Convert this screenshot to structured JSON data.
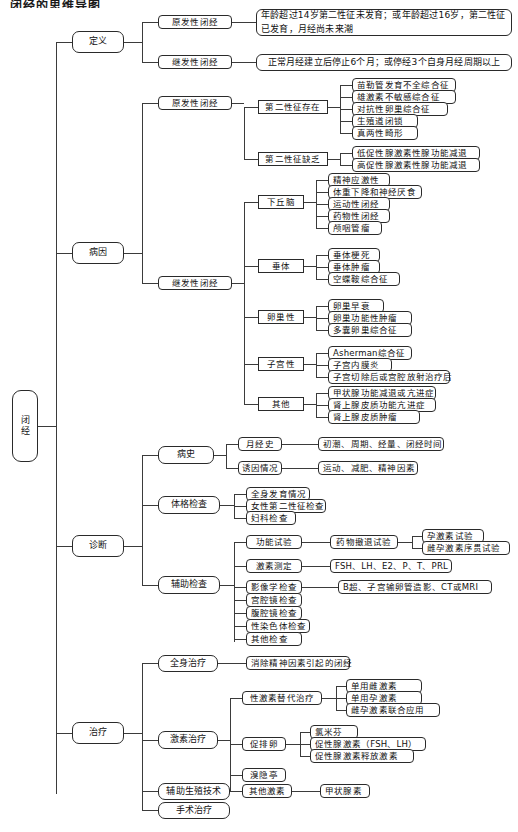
{
  "document": {
    "title_partial": "闭经的思维导图",
    "root": "闭经"
  },
  "branches": {
    "definition": {
      "label": "定义",
      "children": [
        {
          "label": "原发性闭经",
          "detail": "年龄超过14岁第二性征未发育；或年龄超过16岁，第二性征已发育，月经尚未来潮"
        },
        {
          "label": "继发性闭经",
          "detail": "正常月经建立后停止6个月；或停经3个自身月经周期以上"
        }
      ]
    },
    "etiology": {
      "label": "病因",
      "children": [
        {
          "label": "原发性闭经",
          "groups": [
            {
              "label": "第二性征存在",
              "items": [
                "苗勒管发育不全综合征",
                "雄激素不敏感综合征",
                "对抗性卵巢综合征",
                "生殖道闭锁",
                "真两性畸形"
              ]
            },
            {
              "label": "第二性征缺乏",
              "items": [
                "低促性腺激素性腺功能减退",
                "高促性腺激素性腺功能减退"
              ]
            }
          ]
        },
        {
          "label": "继发性闭经",
          "groups": [
            {
              "label": "下丘脑",
              "items": [
                "精神应激性",
                "体重下降和神经厌食",
                "运动性闭经",
                "药物性闭经",
                "颅咽管瘤"
              ]
            },
            {
              "label": "垂体",
              "items": [
                "垂体梗死",
                "垂体肿瘤",
                "空蝶鞍综合征"
              ]
            },
            {
              "label": "卵巢性",
              "items": [
                "卵巢早衰",
                "卵巢功能性肿瘤",
                "多囊卵巢综合征"
              ]
            },
            {
              "label": "子宫性",
              "items": [
                "Asherman综合征",
                "子宫内膜炎",
                "子宫切除后或宫腔放射治疗后"
              ]
            },
            {
              "label": "其他",
              "items": [
                "甲状腺功能减退或亢进症",
                "肾上腺皮质功能亢进症",
                "肾上腺皮质肿瘤"
              ]
            }
          ]
        }
      ]
    },
    "diagnosis": {
      "label": "诊断",
      "children": [
        {
          "label": "病史",
          "items": [
            {
              "label": "月经史",
              "detail": "初潮、周期、经量、闭经时间"
            },
            {
              "label": "诱因情况",
              "detail": "运动、减肥、精神因素"
            }
          ]
        },
        {
          "label": "体格检查",
          "items": [
            {
              "label": "全身发育情况"
            },
            {
              "label": "女性第二性征检查"
            },
            {
              "label": "妇科检查"
            }
          ]
        },
        {
          "label": "辅助检查",
          "items": [
            {
              "label": "功能试验",
              "detail": "药物撤退试验",
              "subitems": [
                "孕激素试验",
                "雌孕激素序贯试验"
              ]
            },
            {
              "label": "激素测定",
              "detail": "FSH、LH、E2、P、T、PRL"
            },
            {
              "label": "影像学检查",
              "detail": "B超、子宫输卵管造影、CT或MRI"
            },
            {
              "label": "宫腔镜检查"
            },
            {
              "label": "腹腔镜检查"
            },
            {
              "label": "性染色体检查"
            },
            {
              "label": "其他检查"
            }
          ]
        }
      ]
    },
    "treatment": {
      "label": "治疗",
      "children": [
        {
          "label": "全身治疗",
          "detail": "消除精神因素引起的闭经"
        },
        {
          "label": "激素治疗",
          "items": [
            {
              "label": "性激素替代治疗",
              "subitems": [
                "单用雌激素",
                "单用孕激素",
                "雌孕激素联合应用"
              ]
            },
            {
              "label": "促排卵",
              "subitems": [
                "氯米芬",
                "促性腺激素（FSH、LH）",
                "促性腺激素释放激素"
              ]
            },
            {
              "label": "溴隐亭"
            },
            {
              "label": "其他激素",
              "detail": "甲状腺素"
            }
          ]
        },
        {
          "label": "辅助生殖技术"
        },
        {
          "label": "手术治疗"
        }
      ]
    }
  },
  "colors": {
    "line": "#3b3b3b",
    "border": "#2a2a2a",
    "text": "#111111",
    "background": "#ffffff"
  }
}
